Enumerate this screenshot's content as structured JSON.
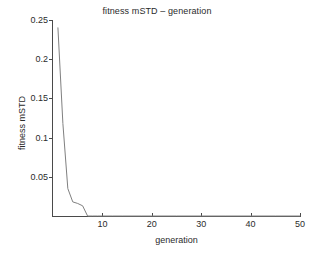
{
  "chart_data": {
    "type": "line",
    "title": "fitness mSTD – generation",
    "xlabel": "generation",
    "ylabel": "fitness mSTD",
    "xlim": [
      0,
      50
    ],
    "ylim": [
      0,
      0.25
    ],
    "grid": false,
    "legend": null,
    "xticks": [
      10,
      20,
      30,
      40,
      50
    ],
    "xtick_labels": [
      "10",
      "20",
      "30",
      "40",
      "50"
    ],
    "yticks": [
      0.05,
      0.1,
      0.15,
      0.2,
      0.25
    ],
    "ytick_labels": [
      "0.05",
      "0.1",
      "0.15",
      "0.2",
      "0.25"
    ],
    "line_color": "#808080",
    "line_width": 1,
    "series": [
      {
        "name": "fitness mSTD",
        "x": [
          1,
          2,
          3,
          4,
          5,
          6,
          7,
          8,
          9,
          10,
          12,
          14,
          16,
          18,
          20,
          25,
          30,
          35,
          40,
          45,
          50
        ],
        "values": [
          0.24,
          0.118,
          0.035,
          0.018,
          0.016,
          0.013,
          0.0,
          0.0,
          0.0,
          0.0,
          0.0,
          0.0,
          0.0,
          0.0,
          0.0,
          0.0,
          0.0,
          0.0,
          0.0,
          0.0,
          0.0
        ]
      }
    ]
  },
  "figure": {
    "background": "#ffffff",
    "axis_color": "#4a4a4a",
    "text_color": "#2b2b2b"
  }
}
